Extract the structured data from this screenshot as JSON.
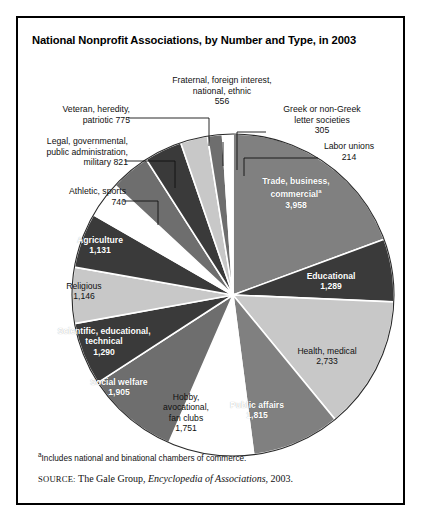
{
  "title": "National Nonprofit Associations, by Number and Type, in 2003",
  "footnote": {
    "marker": "a",
    "text": "Includes national and binational chambers of commerce."
  },
  "source": {
    "label": "SOURCE:",
    "publisher": "The Gale Group,",
    "work": "Encyclopedia of Associations",
    "year": ", 2003."
  },
  "chart_data": {
    "type": "pie",
    "title": "National Nonprofit Associations, by Number and Type, in 2003",
    "xlabel": "",
    "ylabel": "",
    "total": 20429,
    "start_angle_deg": 0,
    "direction": "clockwise",
    "legend": "none (direct labels)",
    "grid": false,
    "categories": [
      "Trade, business, commercial",
      "Educational",
      "Health, medical",
      "Public affairs",
      "Hobby, avocational, fan clubs",
      "Social welfare",
      "Scientific, educational, technical",
      "Religious",
      "Agriculture",
      "Athletic, sports",
      "Legal, governmental, public administration, military",
      "Veteran, heredity, patriotic",
      "Fraternal, foreign interest, national, ethnic",
      "Greek or non-Greek letter societies",
      "Labor unions"
    ],
    "values": [
      3958,
      1289,
      2733,
      1815,
      1751,
      1905,
      1290,
      1146,
      1131,
      740,
      821,
      775,
      556,
      305,
      214
    ],
    "colors": [
      "#808080",
      "#3a3a3a",
      "#c8c8c8",
      "#808080",
      "#ffffff",
      "#6e6e6e",
      "#3a3a3a",
      "#c8c8c8",
      "#3a3a3a",
      "#ffffff",
      "#6e6e6e",
      "#3a3a3a",
      "#c8c8c8",
      "#6e6e6e",
      "#ffffff"
    ],
    "slices": [
      {
        "label": "Trade, business, commercial",
        "value": 3958,
        "value_text": "3,958",
        "has_footnote": true,
        "color": "#808080",
        "label_placement": "inside"
      },
      {
        "label": "Educational",
        "value": 1289,
        "value_text": "1,289",
        "color": "#3a3a3a",
        "label_placement": "inside"
      },
      {
        "label": "Health, medical",
        "value": 2733,
        "value_text": "2,733",
        "color": "#c8c8c8",
        "label_placement": "inside"
      },
      {
        "label": "Public affairs",
        "value": 1815,
        "value_text": "1,815",
        "color": "#808080",
        "label_placement": "inside"
      },
      {
        "label": "Hobby, avocational, fan clubs",
        "value": 1751,
        "value_text": "1,751",
        "color": "#ffffff",
        "label_placement": "inside"
      },
      {
        "label": "Social welfare",
        "value": 1905,
        "value_text": "1,905",
        "color": "#6e6e6e",
        "label_placement": "inside"
      },
      {
        "label": "Scientific, educational, technical",
        "value": 1290,
        "value_text": "1,290",
        "color": "#3a3a3a",
        "label_placement": "inside"
      },
      {
        "label": "Religious",
        "value": 1146,
        "value_text": "1,146",
        "color": "#c8c8c8",
        "label_placement": "inside"
      },
      {
        "label": "Agriculture",
        "value": 1131,
        "value_text": "1,131",
        "color": "#3a3a3a",
        "label_placement": "inside"
      },
      {
        "label": "Athletic, sports",
        "value": 740,
        "value_text": "740",
        "color": "#ffffff",
        "label_placement": "outside-left"
      },
      {
        "label": "Legal, governmental, public administration, military",
        "value": 821,
        "value_text": "821",
        "color": "#6e6e6e",
        "label_placement": "outside-left"
      },
      {
        "label": "Veteran, heredity, patriotic",
        "value": 775,
        "value_text": "775",
        "color": "#3a3a3a",
        "label_placement": "outside-left"
      },
      {
        "label": "Fraternal, foreign interest, national, ethnic",
        "value": 556,
        "value_text": "556",
        "color": "#c8c8c8",
        "label_placement": "outside-top"
      },
      {
        "label": "Greek or non-Greek letter societies",
        "value": 305,
        "value_text": "305",
        "color": "#6e6e6e",
        "label_placement": "outside-right"
      },
      {
        "label": "Labor unions",
        "value": 214,
        "value_text": "214",
        "color": "#ffffff",
        "label_placement": "outside-right"
      }
    ]
  },
  "callouts": {
    "fraternal": {
      "line1": "Fraternal, foreign interest,",
      "line2": "national, ethnic",
      "line3": "556"
    },
    "veteran": {
      "line1": "Veteran, heredity,",
      "line2": "patriotic  775"
    },
    "legal": {
      "line1": "Legal, governmental,",
      "line2": "public administration,",
      "line3": "military  821"
    },
    "athletic": {
      "line1": "Athletic, sports",
      "line2": "740"
    },
    "greek": {
      "line1": "Greek or non-Greek",
      "line2": "letter societies",
      "line3": "305"
    },
    "labor": {
      "line1": "Labor unions",
      "line2": "214"
    }
  },
  "inside_labels": {
    "trade": {
      "line1": "Trade, business,",
      "line2": "commercial",
      "line3": "3,958"
    },
    "educational": {
      "line1": "Educational",
      "line2": "1,289"
    },
    "health": {
      "line1": "Health, medical",
      "line2": "2,733"
    },
    "public_affairs": {
      "line1": "Public affairs",
      "line2": "1,815"
    },
    "hobby": {
      "line1": "Hobby,",
      "line2": "avocational,",
      "line3": "fan clubs",
      "line4": "1,751"
    },
    "social_welfare": {
      "line1": "Social welfare",
      "line2": "1,905"
    },
    "scientific": {
      "line1": "Scientific, educational,",
      "line2": "technical",
      "line3": "1,290"
    },
    "religious": {
      "line1": "Religious",
      "line2": "1,146"
    },
    "agriculture": {
      "line1": "Agriculture",
      "line2": "1,131"
    }
  }
}
